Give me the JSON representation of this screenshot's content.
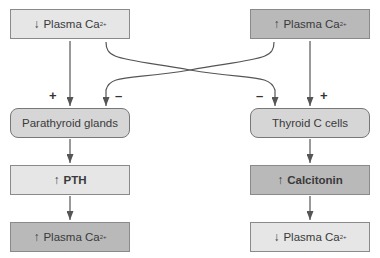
{
  "diagram": {
    "left": {
      "stimulus": {
        "arrow": "↓",
        "label": "Plasma Ca",
        "sup": "2+"
      },
      "effector": {
        "label": "Parathyroid glands"
      },
      "hormone": {
        "arrow": "↑",
        "label": "PTH"
      },
      "result": {
        "arrow": "↑",
        "label": "Plasma Ca",
        "sup": "2+"
      }
    },
    "right": {
      "stimulus": {
        "arrow": "↑",
        "label": "Plasma Ca",
        "sup": "2+"
      },
      "effector": {
        "label": "Thyroid C cells"
      },
      "hormone": {
        "arrow": "↑",
        "label": "Calcitonin"
      },
      "result": {
        "arrow": "↓",
        "label": "Plasma Ca",
        "sup": "2+"
      }
    },
    "signs": {
      "left_plus": "+",
      "left_minus": "–",
      "right_minus": "–",
      "right_plus": "+"
    },
    "colors": {
      "light_box": "#e6e6e6",
      "dark_box": "#b9b9b9",
      "effector_box": "#d6d6d6",
      "line": "#555555"
    }
  }
}
